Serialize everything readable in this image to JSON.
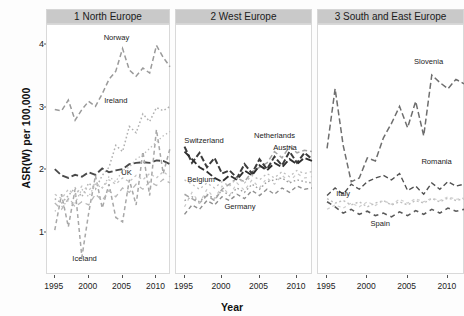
{
  "chart_data": {
    "type": "line",
    "title": "",
    "xlabel": "Year",
    "ylabel": "ASR(W) per 100,000",
    "xlim": [
      1994,
      2012
    ],
    "ylim": [
      0.35,
      4.3
    ],
    "xticks": [
      1995,
      2000,
      2005,
      2010
    ],
    "yticks": [
      1,
      2,
      3,
      4
    ],
    "grid": false,
    "legend_position": "inline-annotations",
    "facets": [
      {
        "id": "panel-north-europe",
        "label": "1 North Europe",
        "series": [
          {
            "name": "Norway",
            "label_x": 2004.1,
            "label_y": 4.07,
            "color": "#9a9a9a",
            "dash": "5 3",
            "width": 1.5,
            "x": [
              1995,
              1996,
              1997,
              1998,
              1999,
              2000,
              2001,
              2002,
              2003,
              2004,
              2005,
              2006,
              2007,
              2008,
              2009,
              2010,
              2011,
              2012
            ],
            "y": [
              2.97,
              2.95,
              3.12,
              2.8,
              2.97,
              3.1,
              3.02,
              3.22,
              3.45,
              3.58,
              3.94,
              3.6,
              3.5,
              3.63,
              3.55,
              3.99,
              3.8,
              3.65
            ]
          },
          {
            "name": "Ireland",
            "label_x": 2004.0,
            "label_y": 3.07,
            "color": "#b0b0b0",
            "dash": "1.6 2.4",
            "width": 1.5,
            "x": [
              1995,
              1996,
              1997,
              1998,
              1999,
              2000,
              2001,
              2002,
              2003,
              2004,
              2005,
              2006,
              2007,
              2008,
              2009,
              2010,
              2011,
              2012
            ],
            "y": [
              1.55,
              1.48,
              1.6,
              1.72,
              1.58,
              1.8,
              1.7,
              1.92,
              2.05,
              2.4,
              2.3,
              2.7,
              2.6,
              2.9,
              2.78,
              3.0,
              2.95,
              3.02
            ]
          },
          {
            "name": "UK",
            "label_x": 2005.6,
            "label_y": 1.93,
            "color": "#4a4a4a",
            "dash": "7 3",
            "width": 1.9,
            "x": [
              1995,
              1996,
              1997,
              1998,
              1999,
              2000,
              2001,
              2002,
              2003,
              2004,
              2005,
              2006,
              2007,
              2008,
              2009,
              2010,
              2011,
              2012
            ],
            "y": [
              2.02,
              1.92,
              1.88,
              1.93,
              1.9,
              1.97,
              1.93,
              2.03,
              1.97,
              2.0,
              2.02,
              2.1,
              2.12,
              2.13,
              2.12,
              2.16,
              2.15,
              2.1
            ]
          },
          {
            "name": "Iceland",
            "label_x": 1999.4,
            "label_y": 0.55,
            "color": "#a8a8a8",
            "dash": "4 3",
            "width": 1.5,
            "x": [
              1995,
              1996,
              1997,
              1998,
              1999,
              2000,
              2001,
              2002,
              2003,
              2004,
              2005,
              2006,
              2007,
              2008,
              2009,
              2010,
              2011,
              2012
            ],
            "y": [
              1.05,
              1.62,
              1.1,
              1.7,
              0.62,
              1.32,
              1.92,
              1.4,
              1.78,
              1.25,
              1.18,
              1.85,
              1.45,
              2.3,
              1.6,
              2.65,
              1.95,
              2.35
            ]
          },
          {
            "name": "Denmark",
            "label_x": null,
            "label_y": null,
            "color": "#bcbcbc",
            "dash": "1.4 2.6",
            "width": 1.3,
            "x": [
              1995,
              1996,
              1997,
              1998,
              1999,
              2000,
              2001,
              2002,
              2003,
              2004,
              2005,
              2006,
              2007,
              2008,
              2009,
              2010,
              2011,
              2012
            ],
            "y": [
              1.35,
              1.42,
              1.52,
              1.48,
              1.7,
              1.58,
              1.78,
              1.72,
              1.9,
              1.82,
              2.0,
              2.05,
              2.18,
              2.25,
              2.35,
              2.45,
              2.55,
              2.62
            ]
          },
          {
            "name": "Sweden",
            "label_x": null,
            "label_y": null,
            "color": "#c4c4c4",
            "dash": "2.5 3",
            "width": 1.3,
            "x": [
              1995,
              1996,
              1997,
              1998,
              1999,
              2000,
              2001,
              2002,
              2003,
              2004,
              2005,
              2006,
              2007,
              2008,
              2009,
              2010,
              2011,
              2012
            ],
            "y": [
              1.62,
              1.55,
              1.7,
              1.6,
              1.75,
              1.68,
              1.8,
              1.72,
              1.85,
              1.78,
              1.88,
              1.82,
              1.92,
              1.85,
              1.95,
              1.88,
              1.98,
              1.9
            ]
          },
          {
            "name": "Finland",
            "label_x": null,
            "label_y": null,
            "color": "#b8b8b8",
            "dash": "5 4",
            "width": 1.3,
            "x": [
              1995,
              1996,
              1997,
              1998,
              1999,
              2000,
              2001,
              2002,
              2003,
              2004,
              2005,
              2006,
              2007,
              2008,
              2009,
              2010,
              2011,
              2012
            ],
            "y": [
              1.48,
              1.38,
              1.55,
              1.42,
              1.5,
              1.45,
              1.62,
              1.52,
              1.68,
              1.58,
              1.72,
              1.65,
              1.78,
              1.7,
              1.82,
              1.76,
              1.86,
              1.8
            ]
          }
        ]
      },
      {
        "id": "panel-west-europe",
        "label": "2 West Europe",
        "series": [
          {
            "name": "Netherlands",
            "label_x": 2007.0,
            "label_y": 2.52,
            "color": "#a5a5a5",
            "dash": "5 3",
            "width": 1.5,
            "x": [
              1995,
              1996,
              1997,
              1998,
              1999,
              2000,
              2001,
              2002,
              2003,
              2004,
              2005,
              2006,
              2007,
              2008,
              2009,
              2010,
              2011,
              2012
            ],
            "y": [
              1.62,
              1.55,
              1.48,
              1.6,
              1.52,
              1.7,
              1.78,
              1.88,
              1.82,
              1.98,
              2.05,
              2.12,
              2.3,
              2.2,
              2.38,
              2.28,
              2.32,
              2.3
            ]
          },
          {
            "name": "Switzerland",
            "label_x": 1997.6,
            "label_y": 2.44,
            "color": "#3c3c3c",
            "dash": "6 2.5",
            "width": 2.0,
            "x": [
              1995,
              1996,
              1997,
              1998,
              1999,
              2000,
              2001,
              2002,
              2003,
              2004,
              2005,
              2006,
              2007,
              2008,
              2009,
              2010,
              2011,
              2012
            ],
            "y": [
              2.38,
              2.12,
              2.28,
              2.05,
              2.2,
              1.95,
              2.0,
              1.88,
              2.1,
              1.95,
              2.18,
              2.02,
              2.22,
              2.08,
              2.3,
              2.12,
              2.28,
              2.18
            ]
          },
          {
            "name": "Austria",
            "label_x": 2008.4,
            "label_y": 2.32,
            "color": "#2f2f2f",
            "dash": "7 3",
            "width": 1.9,
            "x": [
              1995,
              1996,
              1997,
              1998,
              1999,
              2000,
              2001,
              2002,
              2003,
              2004,
              2005,
              2006,
              2007,
              2008,
              2009,
              2010,
              2011,
              2012
            ],
            "y": [
              2.3,
              2.18,
              2.05,
              1.98,
              1.88,
              1.82,
              1.92,
              1.85,
              2.0,
              1.92,
              2.08,
              2.0,
              2.12,
              2.05,
              2.18,
              2.1,
              2.2,
              2.15
            ]
          },
          {
            "name": "Belgium",
            "label_x": 1997.2,
            "label_y": 1.82,
            "color": "#9e9e9e",
            "dash": "1.6 2.4",
            "width": 1.4,
            "x": [
              1995,
              1996,
              1997,
              1998,
              1999,
              2000,
              2001,
              2002,
              2003,
              2004,
              2005,
              2006,
              2007,
              2008,
              2009,
              2010,
              2011,
              2012
            ],
            "y": [
              1.52,
              1.58,
              1.5,
              1.62,
              1.55,
              1.68,
              1.6,
              1.72,
              1.65,
              1.78,
              1.7,
              1.82,
              1.85,
              1.88,
              1.8,
              1.85,
              1.82,
              1.8
            ]
          },
          {
            "name": "Germany",
            "label_x": 2002.4,
            "label_y": 1.38,
            "color": "#8f8f8f",
            "dash": "4 3",
            "width": 1.4,
            "x": [
              1995,
              1996,
              1997,
              1998,
              1999,
              2000,
              2001,
              2002,
              2003,
              2004,
              2005,
              2006,
              2007,
              2008,
              2009,
              2010,
              2011,
              2012
            ],
            "y": [
              1.3,
              1.45,
              1.38,
              1.52,
              1.45,
              1.58,
              1.52,
              1.62,
              1.55,
              1.68,
              1.6,
              1.7,
              1.62,
              1.72,
              1.65,
              1.75,
              1.7,
              1.72
            ]
          },
          {
            "name": "France",
            "label_x": null,
            "label_y": null,
            "color": "#bdbdbd",
            "dash": "2 3",
            "width": 1.3,
            "x": [
              1995,
              1996,
              1997,
              1998,
              1999,
              2000,
              2001,
              2002,
              2003,
              2004,
              2005,
              2006,
              2007,
              2008,
              2009,
              2010,
              2011,
              2012
            ],
            "y": [
              1.85,
              1.78,
              1.7,
              1.8,
              1.72,
              1.82,
              1.75,
              1.88,
              1.8,
              1.92,
              1.85,
              1.95,
              1.88,
              1.98,
              1.9,
              2.0,
              1.95,
              1.98
            ]
          },
          {
            "name": "Luxembourg",
            "label_x": null,
            "label_y": null,
            "color": "#c8c8c8",
            "dash": "3 4",
            "width": 1.2,
            "x": [
              1995,
              1996,
              1997,
              1998,
              1999,
              2000,
              2001,
              2002,
              2003,
              2004,
              2005,
              2006,
              2007,
              2008,
              2009,
              2010,
              2011,
              2012
            ],
            "y": [
              1.42,
              1.65,
              1.48,
              1.7,
              1.55,
              1.75,
              1.6,
              1.8,
              1.68,
              1.85,
              1.72,
              1.88,
              1.78,
              1.92,
              1.82,
              1.95,
              1.88,
              1.9
            ]
          }
        ]
      },
      {
        "id": "panel-south-east-europe",
        "label": "3 South and East Europe",
        "series": [
          {
            "name": "Slovenia",
            "label_x": 2007.6,
            "label_y": 3.7,
            "color": "#6e6e6e",
            "dash": "6 3",
            "width": 1.5,
            "x": [
              1995,
              1996,
              1997,
              1998,
              1999,
              2000,
              2001,
              2002,
              2003,
              2004,
              2005,
              2006,
              2007,
              2008,
              2009,
              2010,
              2011,
              2012
            ],
            "y": [
              2.35,
              3.3,
              2.4,
              1.82,
              1.88,
              2.2,
              2.15,
              2.52,
              2.75,
              3.02,
              2.68,
              3.1,
              2.55,
              3.52,
              3.4,
              3.3,
              3.45,
              3.38
            ]
          },
          {
            "name": "Romania",
            "label_x": 2008.6,
            "label_y": 2.1,
            "color": "#515151",
            "dash": "5 3",
            "width": 1.4,
            "x": [
              1995,
              1996,
              1997,
              1998,
              1999,
              2000,
              2001,
              2002,
              2003,
              2004,
              2005,
              2006,
              2007,
              2008,
              2009,
              2010,
              2011,
              2012
            ],
            "y": [
              1.6,
              1.72,
              1.62,
              1.78,
              1.7,
              1.82,
              1.88,
              1.92,
              1.85,
              1.95,
              1.68,
              1.75,
              1.62,
              1.8,
              1.7,
              1.82,
              1.75,
              1.78
            ]
          },
          {
            "name": "Italy",
            "label_x": 1997.0,
            "label_y": 1.6,
            "color": "#bfbfbf",
            "dash": "2 2.5",
            "width": 1.4,
            "x": [
              1995,
              1996,
              1997,
              1998,
              1999,
              2000,
              2001,
              2002,
              2003,
              2004,
              2005,
              2006,
              2007,
              2008,
              2009,
              2010,
              2011,
              2012
            ],
            "y": [
              1.55,
              1.48,
              1.52,
              1.45,
              1.5,
              1.42,
              1.48,
              1.52,
              1.45,
              1.5,
              1.45,
              1.52,
              1.48,
              1.55,
              1.5,
              1.56,
              1.52,
              1.55
            ]
          },
          {
            "name": "Spain",
            "label_x": 2001.6,
            "label_y": 1.12,
            "color": "#5a5a5a",
            "dash": "5 4",
            "width": 1.6,
            "x": [
              1995,
              1996,
              1997,
              1998,
              1999,
              2000,
              2001,
              2002,
              2003,
              2004,
              2005,
              2006,
              2007,
              2008,
              2009,
              2010,
              2011,
              2012
            ],
            "y": [
              1.5,
              1.42,
              1.32,
              1.38,
              1.3,
              1.35,
              1.28,
              1.32,
              1.26,
              1.34,
              1.28,
              1.36,
              1.3,
              1.38,
              1.32,
              1.4,
              1.35,
              1.38
            ]
          },
          {
            "name": "Croatia",
            "label_x": null,
            "label_y": null,
            "color": "#cfcfcf",
            "dash": "3 3",
            "width": 1.2,
            "x": [
              1995,
              1996,
              1997,
              1998,
              1999,
              2000,
              2001,
              2002,
              2003,
              2004,
              2005,
              2006,
              2007,
              2008,
              2009,
              2010,
              2011,
              2012
            ],
            "y": [
              1.38,
              1.45,
              1.4,
              1.48,
              1.42,
              1.5,
              1.44,
              1.52,
              1.46,
              1.54,
              1.48,
              1.55,
              1.5,
              1.56,
              1.52,
              1.58,
              1.54,
              1.56
            ]
          }
        ]
      }
    ]
  }
}
